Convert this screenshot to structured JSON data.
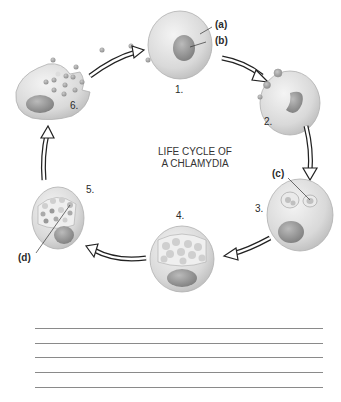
{
  "diagram": {
    "title_line1": "LIFE CYCLE OF",
    "title_line2": "A CHLAMYDIA",
    "stages": [
      {
        "number": "1."
      },
      {
        "number": "2."
      },
      {
        "number": "3."
      },
      {
        "number": "4."
      },
      {
        "number": "5."
      },
      {
        "number": "6."
      }
    ],
    "labels": {
      "a": "(a)",
      "b": "(b)",
      "c": "(c)",
      "d": "(d)"
    },
    "answer_lines": 5
  }
}
